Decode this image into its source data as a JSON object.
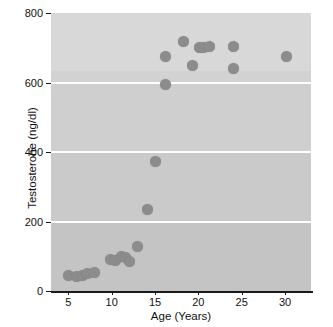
{
  "chart_data": {
    "type": "scatter",
    "title": "",
    "xlabel": "Age (Years)",
    "ylabel": "Testosterone (ng/dl)",
    "xlim": [
      3,
      33
    ],
    "ylim": [
      0,
      800
    ],
    "xticks": [
      5,
      10,
      15,
      20,
      25,
      30
    ],
    "yticks": [
      0,
      200,
      400,
      600,
      800
    ],
    "grid": "horizontal-white",
    "legend": "none",
    "series": [
      {
        "name": "Testosterone vs Age",
        "marker": "circle",
        "color": "#8c8c8c",
        "points": [
          {
            "x": 5.0,
            "y": 45
          },
          {
            "x": 5.9,
            "y": 42
          },
          {
            "x": 6.6,
            "y": 45
          },
          {
            "x": 7.2,
            "y": 50
          },
          {
            "x": 8.0,
            "y": 52
          },
          {
            "x": 9.9,
            "y": 90
          },
          {
            "x": 10.4,
            "y": 88
          },
          {
            "x": 11.1,
            "y": 100
          },
          {
            "x": 11.6,
            "y": 95
          },
          {
            "x": 12.1,
            "y": 85
          },
          {
            "x": 13.0,
            "y": 128
          },
          {
            "x": 14.1,
            "y": 235
          },
          {
            "x": 15.1,
            "y": 372
          },
          {
            "x": 16.2,
            "y": 675
          },
          {
            "x": 16.2,
            "y": 595
          },
          {
            "x": 18.3,
            "y": 718
          },
          {
            "x": 19.3,
            "y": 650
          },
          {
            "x": 20.1,
            "y": 700
          },
          {
            "x": 20.6,
            "y": 700
          },
          {
            "x": 21.3,
            "y": 703
          },
          {
            "x": 24.1,
            "y": 703
          },
          {
            "x": 24.1,
            "y": 640
          },
          {
            "x": 30.2,
            "y": 676
          }
        ]
      }
    ]
  },
  "axes": {
    "x_tick_labels": [
      "5",
      "10",
      "15",
      "20",
      "25",
      "30"
    ],
    "y_tick_labels": [
      "0",
      "200",
      "400",
      "600",
      "800"
    ],
    "x_axis_title": "Age (Years)",
    "y_axis_title": "Testosterone (ng/dl)"
  },
  "style": {
    "plot_background": "#c9c9c9",
    "gridline_color": "#ffffff",
    "marker_color": "#8c8c8c",
    "axis_color": "#1a1a1a",
    "page_background": "#ffffff"
  }
}
